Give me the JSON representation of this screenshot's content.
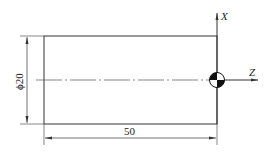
{
  "drawing": {
    "title": "Workpiece coordinate system drawing",
    "part": {
      "shape": "rectangle",
      "diameter_label": "ϕ20",
      "length_label": "50"
    },
    "axes": {
      "x_label": "X",
      "z_label": "Z"
    },
    "origin_symbol": "workpiece-zero-symbol",
    "colors": {
      "line": "#333333",
      "text": "#222222",
      "background": "#ffffff"
    }
  }
}
